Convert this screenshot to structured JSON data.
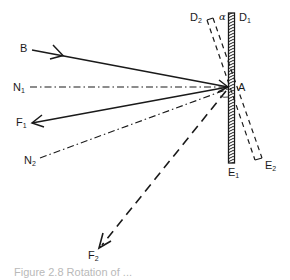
{
  "figure": {
    "type": "optics-ray-diagram",
    "colors": {
      "ink": "#1a1a1a",
      "background": "#ffffff",
      "caption": "#b9b9b9"
    },
    "labels": {
      "B": "B",
      "N1_main": "N",
      "N1_sub": "1",
      "F1_main": "F",
      "F1_sub": "1",
      "N2_main": "N",
      "N2_sub": "2",
      "F2_main": "F",
      "F2_sub": "2",
      "A": "A",
      "D1_main": "D",
      "D1_sub": "1",
      "D2_main": "D",
      "D2_sub": "2",
      "E1_main": "E",
      "E1_sub": "1",
      "E2_main": "E",
      "E2_sub": "2",
      "alpha": "α"
    },
    "elements": {
      "mirror_original": "D1E1 (solid, hatched)",
      "mirror_rotated": "D2E2 (dashed outline)",
      "incident_ray": "B to A",
      "normal_original": "N1 (dash-dot)",
      "reflected_original": "A to F1",
      "normal_rotated": "N2 (dash-dot)",
      "reflected_rotated": "A to F2 (dashed)"
    },
    "caption": "Figure 2.8 Rotation of ..."
  }
}
